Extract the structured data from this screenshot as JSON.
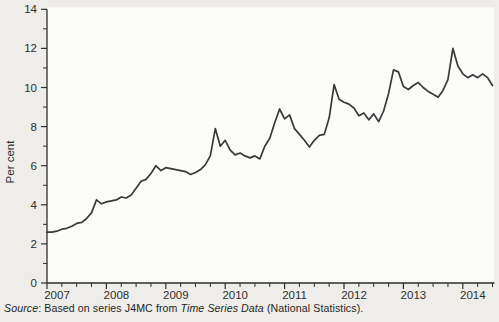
{
  "source_note": {
    "source_word": "Source",
    "text_before_italic": ": Based on series J4MC from ",
    "italic_text": "Time Series Data",
    "text_after_italic": " (National Statistics)."
  },
  "chart_data": {
    "type": "line",
    "title": "",
    "xlabel": "",
    "ylabel": "Per cent",
    "ylim": [
      0,
      14
    ],
    "y_major_ticks": [
      0,
      2,
      4,
      6,
      8,
      10,
      12,
      14
    ],
    "y_minor_ticks": [
      1,
      3,
      5,
      7,
      9,
      11,
      13
    ],
    "x_years": [
      "2007",
      "2008",
      "2009",
      "2010",
      "2011",
      "2012",
      "2013",
      "2014"
    ],
    "x_minor_tick_interval": "quarterly",
    "x_start": "2007-01",
    "x_end": "2014-07",
    "grid": false,
    "legend": "none",
    "line_color": "#3a3a3a",
    "axis_color": "#2e2e2e",
    "plot_bg": "#fbfbf9",
    "series": [
      {
        "name": "J4MC",
        "frequency": "monthly",
        "values": [
          2.6,
          2.6,
          2.65,
          2.75,
          2.8,
          2.9,
          3.05,
          3.1,
          3.3,
          3.6,
          4.25,
          4.05,
          4.15,
          4.2,
          4.25,
          4.4,
          4.35,
          4.5,
          4.85,
          5.2,
          5.3,
          5.6,
          6.0,
          5.75,
          5.9,
          5.85,
          5.8,
          5.75,
          5.7,
          5.55,
          5.65,
          5.8,
          6.05,
          6.5,
          7.9,
          7.0,
          7.3,
          6.8,
          6.55,
          6.65,
          6.5,
          6.4,
          6.5,
          6.35,
          7.0,
          7.4,
          8.2,
          8.9,
          8.4,
          8.6,
          7.9,
          7.6,
          7.3,
          6.95,
          7.3,
          7.55,
          7.6,
          8.45,
          10.15,
          9.4,
          9.25,
          9.15,
          8.95,
          8.55,
          8.7,
          8.35,
          8.65,
          8.25,
          8.8,
          9.7,
          10.9,
          10.8,
          10.05,
          9.9,
          10.1,
          10.25,
          10.0,
          9.8,
          9.65,
          9.5,
          9.85,
          10.4,
          12.0,
          11.1,
          10.7,
          10.5,
          10.65,
          10.5,
          10.7,
          10.5,
          10.1
        ]
      }
    ]
  }
}
